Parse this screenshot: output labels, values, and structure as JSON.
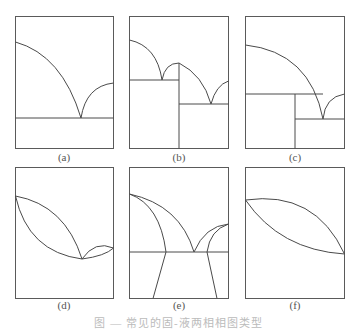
{
  "figure": {
    "caption": "图 — 常见的固-液两相相图类型",
    "panels": [
      {
        "id": "a",
        "label": "(a)"
      },
      {
        "id": "b",
        "label": "(b)"
      },
      {
        "id": "c",
        "label": "(c)"
      },
      {
        "id": "d",
        "label": "(d)"
      },
      {
        "id": "e",
        "label": "(e)"
      },
      {
        "id": "f",
        "label": "(f)"
      }
    ]
  },
  "colors": {
    "line": "#4a4a4a",
    "background": "#ffffff"
  }
}
